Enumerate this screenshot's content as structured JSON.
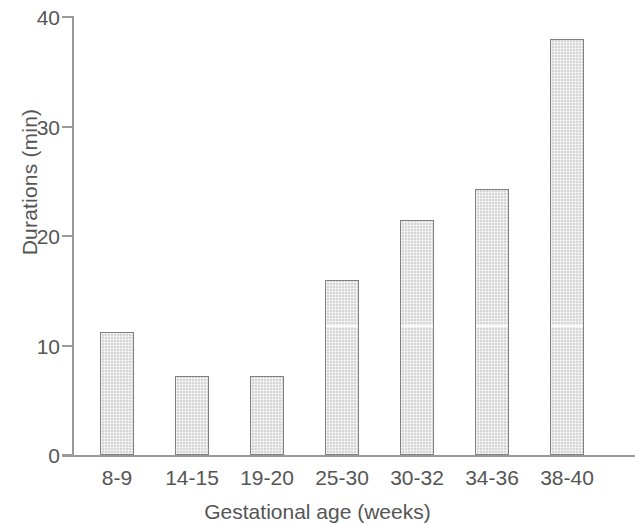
{
  "chart_data": {
    "type": "bar",
    "title": "",
    "xlabel": "Gestational age (weeks)",
    "ylabel": "Durations (min)",
    "categories": [
      "8-9",
      "14-15",
      "19-20",
      "25-30",
      "30-32",
      "34-36",
      "38-40"
    ],
    "values": [
      11.2,
      7.2,
      7.2,
      16.0,
      21.5,
      24.3,
      38.0
    ],
    "ylim": [
      0,
      40
    ],
    "yticks": [
      0,
      10,
      20,
      30,
      40
    ],
    "ytick_labels": [
      "0",
      "10",
      "20",
      "30",
      "40"
    ],
    "grid": false,
    "legend": null,
    "bar_color": "#d6d6d6",
    "bar_edge_color": "#808080",
    "axis_color": "#9a9a9a",
    "text_color": "#555555",
    "background": "#ffffff"
  },
  "artifact": {
    "scanline_value": 11.6,
    "bars_with_scanline": [
      3,
      4,
      5,
      6
    ]
  }
}
